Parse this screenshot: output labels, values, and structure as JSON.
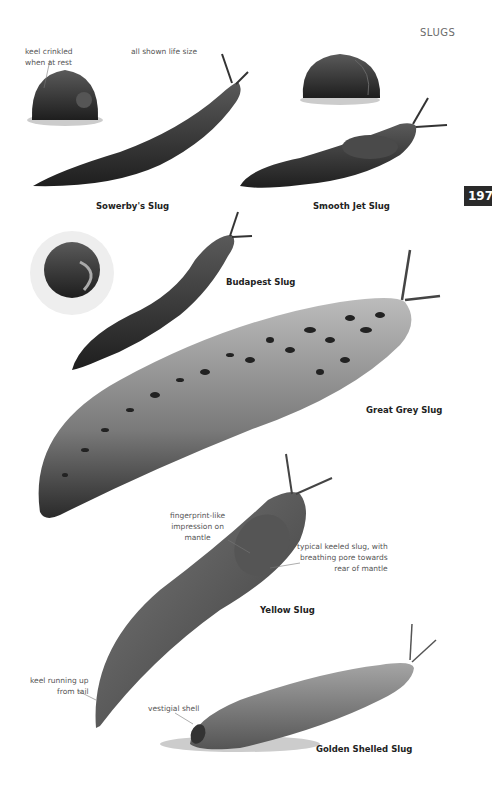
{
  "header": {
    "section_title": "SLUGS",
    "page_number": "197"
  },
  "species": [
    {
      "name": "Sowerby's Slug"
    },
    {
      "name": "Smooth Jet Slug"
    },
    {
      "name": "Budapest Slug"
    },
    {
      "name": "Great Grey Slug"
    },
    {
      "name": "Yellow Slug"
    },
    {
      "name": "Golden Shelled Slug"
    }
  ],
  "annotations": {
    "keel_crinkled": [
      "keel crinkled",
      "when at rest"
    ],
    "life_size": "all shown life size",
    "fingerprint": [
      "fingerprint-like",
      "impression on",
      "mantle"
    ],
    "keeled_slug": [
      "typical keeled slug, with",
      "breathing pore towards",
      "rear of mantle"
    ],
    "keel_running": [
      "keel running up",
      "from tail"
    ],
    "vestigial_shell": "vestigial shell"
  },
  "colors": {
    "page_tab": "#2a2a2a",
    "slug_dark": "#2e2e2e",
    "slug_mid": "#6a6a6a",
    "slug_light": "#a8a8a8"
  }
}
